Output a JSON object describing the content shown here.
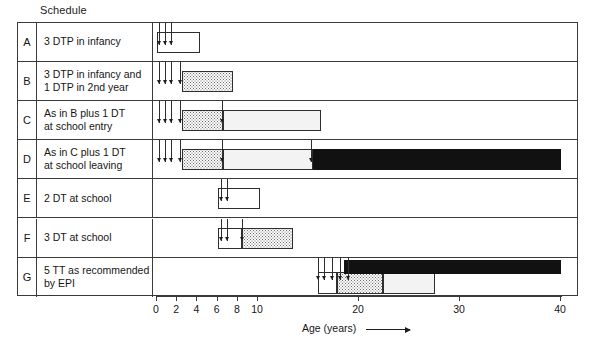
{
  "title": "Schedule",
  "axis": {
    "label": "Age (years)",
    "unit": "years",
    "origin_px": 156,
    "px_per_year": 10.1,
    "ticks": [
      {
        "value": 0,
        "label": "0"
      },
      {
        "value": 2,
        "label": "2"
      },
      {
        "value": 4,
        "label": "4"
      },
      {
        "value": 6,
        "label": "6"
      },
      {
        "value": 8,
        "label": "8"
      },
      {
        "value": 10,
        "label": "10"
      },
      {
        "value": 20,
        "label": "20"
      },
      {
        "value": 30,
        "label": "30"
      },
      {
        "value": 40,
        "label": "40"
      }
    ]
  },
  "chart_data": {
    "type": "bar",
    "title": "Schedule",
    "xlabel": "Age (years)",
    "ylabel": "",
    "xlim": [
      0,
      41
    ],
    "grid": false,
    "legend": "none",
    "categories": [
      "A",
      "B",
      "C",
      "D",
      "E",
      "F",
      "G"
    ],
    "rows": [
      {
        "letter": "A",
        "label_lines": [
          "3 DTP in infancy"
        ],
        "doses": [
          0.2,
          0.8,
          1.4
        ],
        "bars": [
          {
            "start": 0.0,
            "end": 4.3,
            "fill": "white"
          }
        ]
      },
      {
        "letter": "B",
        "label_lines": [
          "3 DTP in infancy and",
          "1 DTP in 2nd year"
        ],
        "doses": [
          0.2,
          0.8,
          1.4,
          2.3
        ],
        "bars": [
          {
            "start": 2.5,
            "end": 7.5,
            "fill": "dots"
          }
        ]
      },
      {
        "letter": "C",
        "label_lines": [
          "As in B plus 1 DT",
          "at school entry"
        ],
        "doses": [
          0.2,
          0.8,
          1.4,
          2.3,
          6.4
        ],
        "bars": [
          {
            "start": 2.5,
            "end": 6.5,
            "fill": "dots"
          },
          {
            "start": 6.5,
            "end": 16.2,
            "fill": "lightdots"
          }
        ]
      },
      {
        "letter": "D",
        "label_lines": [
          "As in C plus 1 DT",
          "at school leaving"
        ],
        "doses": [
          0.2,
          0.8,
          1.4,
          2.3,
          6.4,
          15.2
        ],
        "bars": [
          {
            "start": 2.5,
            "end": 6.5,
            "fill": "dots"
          },
          {
            "start": 6.5,
            "end": 15.4,
            "fill": "lightdots"
          },
          {
            "start": 15.4,
            "end": 40.0,
            "fill": "black"
          }
        ]
      },
      {
        "letter": "E",
        "label_lines": [
          "2 DT at school"
        ],
        "doses": [
          6.3,
          6.9
        ],
        "bars": [
          {
            "start": 6.0,
            "end": 10.2,
            "fill": "white"
          }
        ]
      },
      {
        "letter": "F",
        "label_lines": [
          "3 DT at school"
        ],
        "doses": [
          6.3,
          6.9,
          8.4
        ],
        "bars": [
          {
            "start": 6.0,
            "end": 8.4,
            "fill": "white"
          },
          {
            "start": 8.4,
            "end": 13.5,
            "fill": "dots"
          }
        ]
      },
      {
        "letter": "G",
        "label_lines": [
          "5 TT as recommended",
          "by EPI"
        ],
        "doses": [
          15.9,
          16.5,
          17.3,
          18.1,
          18.9
        ],
        "bars": [
          {
            "start": 15.9,
            "end": 17.8,
            "fill": "white",
            "tier": 2
          },
          {
            "start": 17.8,
            "end": 22.4,
            "fill": "dots",
            "tier": 2
          },
          {
            "start": 22.4,
            "end": 27.5,
            "fill": "lightdots",
            "tier": 2
          },
          {
            "start": 18.5,
            "end": 40.0,
            "fill": "black",
            "tier": 1
          }
        ]
      }
    ]
  }
}
